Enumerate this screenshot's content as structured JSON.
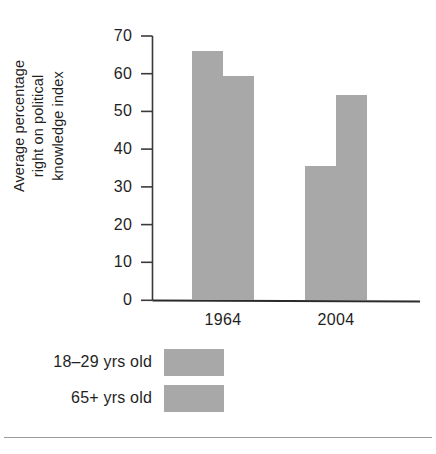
{
  "chart_data": {
    "type": "bar",
    "title": "",
    "subtitle": "",
    "xlabel": "",
    "ylabel": "Average percentage right on political knowledge index",
    "ylabel_lines": [
      "Average percentage",
      "right on political",
      "knowledge index"
    ],
    "categories": [
      "1964",
      "2004"
    ],
    "series": [
      {
        "name": "18–29 yrs old",
        "values": [
          66,
          35.7
        ],
        "color": "#a8a8a8"
      },
      {
        "name": "65+ yrs old",
        "values": [
          59.5,
          54.5
        ],
        "color": "#a8a8a8"
      }
    ],
    "ylim": [
      0,
      70
    ],
    "ytick_step": 10,
    "yticks": [
      0,
      10,
      20,
      30,
      40,
      50,
      60,
      70
    ],
    "ytick_labels": [
      "0",
      "10",
      "20",
      "30",
      "40",
      "50",
      "60",
      "70"
    ],
    "grid": false,
    "legend_position": "below-left"
  },
  "legend": {
    "items": [
      {
        "label": "18–29 yrs old",
        "swatch_name": "legend-swatch-18-29"
      },
      {
        "label": "65+ yrs old",
        "swatch_name": "legend-swatch-65-plus"
      }
    ]
  },
  "colors": {
    "bar_fill": "#a8a8a8",
    "axis": "#3a3a3a",
    "text": "#1f1f1f",
    "footer_rule": "#9a9a9a",
    "background": "#ffffff"
  }
}
